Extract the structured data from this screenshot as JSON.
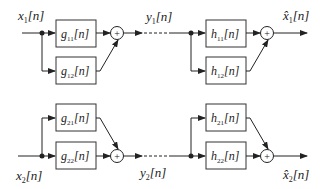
{
  "diagram": {
    "title": "",
    "inputs": [
      {
        "id": "x1",
        "base": "x",
        "sub": "1",
        "suffix": "[n]"
      },
      {
        "id": "x2",
        "base": "x",
        "sub": "2",
        "suffix": "[n]"
      }
    ],
    "channels": [
      {
        "id": "y1",
        "base": "y",
        "sub": "1",
        "suffix": "[n]"
      },
      {
        "id": "y2",
        "base": "y",
        "sub": "2",
        "suffix": "[n]"
      }
    ],
    "outputs": [
      {
        "id": "xhat1",
        "base": "x̂",
        "sub": "1",
        "suffix": "[n]"
      },
      {
        "id": "xhat2",
        "base": "x̂",
        "sub": "2",
        "suffix": "[n]"
      }
    ],
    "encoder_blocks": [
      {
        "id": "g11",
        "base": "g",
        "sub": "11",
        "suffix": "[n]"
      },
      {
        "id": "g12",
        "base": "g",
        "sub": "12",
        "suffix": "[n]"
      },
      {
        "id": "g21",
        "base": "g",
        "sub": "21",
        "suffix": "[n]"
      },
      {
        "id": "g22",
        "base": "g",
        "sub": "22",
        "suffix": "[n]"
      }
    ],
    "decoder_blocks": [
      {
        "id": "h11",
        "base": "h",
        "sub": "11",
        "suffix": "[n]"
      },
      {
        "id": "h12",
        "base": "h",
        "sub": "12",
        "suffix": "[n]"
      },
      {
        "id": "h21",
        "base": "h",
        "sub": "21",
        "suffix": "[n]"
      },
      {
        "id": "h22",
        "base": "h",
        "sub": "22",
        "suffix": "[n]"
      }
    ],
    "summer_symbol": "+"
  }
}
